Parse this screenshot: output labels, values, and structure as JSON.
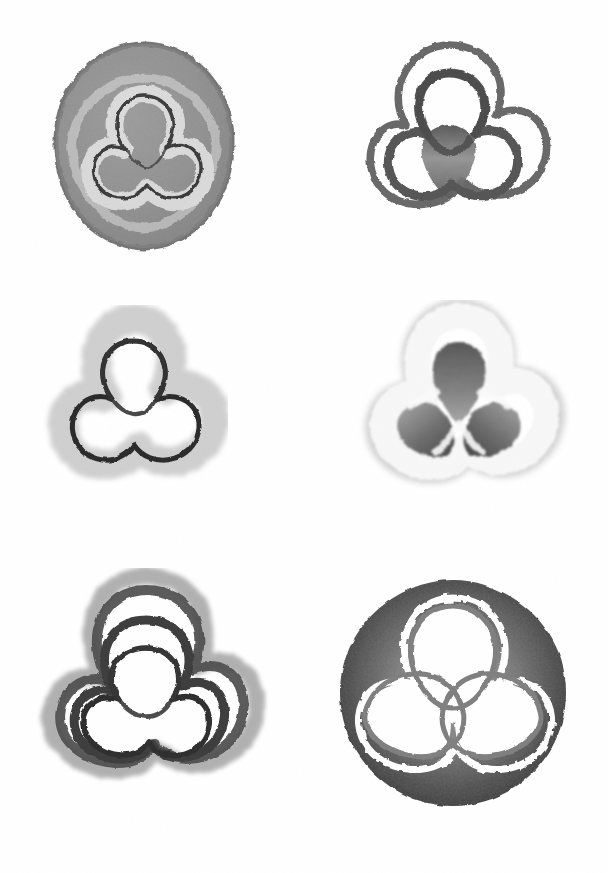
{
  "sheet": {
    "title": "Trefoil Knot Shading Studies",
    "medium": "graphite pencil on white paper",
    "background_color": "#ffffff",
    "width": 608,
    "height": 873,
    "columns": 2,
    "rows": 3,
    "figure_count": 6
  },
  "palette": {
    "paper_white": "#ffffff",
    "near_white": "#f6f6f6",
    "light_grey": "#cfcfcf",
    "mid_grey": "#9a9a9a",
    "grey": "#7d7d7d",
    "dark_grey": "#4a4a4a",
    "near_black": "#2b2b2b",
    "line_black": "#1f1f1f"
  },
  "figures": [
    {
      "id": "figure-1",
      "name": "solid-grey-blob-with-inset-trefoil",
      "position": "top-left",
      "row": 1,
      "column": 1,
      "bounds": {
        "x": 48,
        "y": 38,
        "width": 192,
        "height": 216
      },
      "description": "Rounded triangular grey blob, uniformly shaded mid-grey, with a thin dark trefoil knot line inset and a pale halo band following the knot",
      "fill_style": "solid-wash",
      "fill_color": "#9a9a9a",
      "edge_color": "#6f6f6f",
      "knot_line_color": "#3a3a3a",
      "knot_line_width": 3.2,
      "halo_color": "#e9e9e9",
      "halo_width": 14
    },
    {
      "id": "figure-2",
      "name": "double-outline-trefoil-with-shaded-core",
      "position": "top-right",
      "row": 1,
      "column": 2,
      "bounds": {
        "x": 340,
        "y": 33,
        "width": 218,
        "height": 222
      },
      "description": "Unfilled trefoil knot drawn as a dark band, surrounded by a second offset outer contour, with the central triangular cusp region shaded grey",
      "fill_style": "outline-only",
      "fill_color": "#ffffff",
      "edge_color": "#4f4f4f",
      "knot_line_color": "#5a5a5a",
      "knot_line_width": 9,
      "outer_contour_width": 7,
      "core_shading_color": "#6a6a6a"
    },
    {
      "id": "figure-3",
      "name": "black-trefoil-with-soft-grey-halo",
      "position": "middle-left",
      "row": 2,
      "column": 1,
      "bounds": {
        "x": 38,
        "y": 305,
        "width": 190,
        "height": 200
      },
      "description": "Crisp near-black trefoil knot line with a soft pale grey halo offset outward from the line",
      "fill_style": "halo",
      "fill_color": "#ffffff",
      "edge_color": "#c2c2c2",
      "knot_line_color": "#2b2b2b",
      "knot_line_width": 5,
      "halo_color": "#c8c8c8",
      "halo_width": 26
    },
    {
      "id": "figure-4",
      "name": "white-trefoil-with-dark-filled-lobes",
      "position": "middle-right",
      "row": 2,
      "column": 2,
      "bounds": {
        "x": 348,
        "y": 300,
        "width": 222,
        "height": 218
      },
      "description": "Trefoil drawn in soft white with the three lobe interiors filled with graded grey graphite shading, darkest at the lobe edges",
      "fill_style": "lobe-fill",
      "fill_color": "#ffffff",
      "edge_color": "#b9b9b9",
      "knot_line_color": "#f2f2f2",
      "knot_line_width": 14,
      "lobe_fill_color": "#8a8a8a",
      "lobe_fill_dark": "#5e5e5e"
    },
    {
      "id": "figure-5",
      "name": "concentric-nested-trefoil-contours",
      "position": "bottom-left",
      "row": 3,
      "column": 1,
      "bounds": {
        "x": 24,
        "y": 568,
        "width": 244,
        "height": 262
      },
      "description": "Trefoil knot repeated as several nested contour bands of decreasing radius, dark outline inside a paler grey outer band with a clear white gap between",
      "fill_style": "concentric-contours",
      "fill_color": "#ffffff",
      "edge_color": "#8f8f8f",
      "knot_line_color": "#3a3a3a",
      "knot_line_width": 5,
      "contour_count": 4,
      "contour_gap": 11
    },
    {
      "id": "figure-6",
      "name": "dark-disc-with-white-trefoil-cutout",
      "position": "bottom-right",
      "row": 3,
      "column": 2,
      "bounds": {
        "x": 330,
        "y": 570,
        "width": 246,
        "height": 244
      },
      "description": "Heavily shaded dark circular disc with a white trefoil knot cut out of it, the disc darkest at the rim and lighter toward the centre",
      "fill_style": "solid-disc-cutout",
      "fill_color": "#4a4a4a",
      "edge_color": "#2f2f2f",
      "knot_line_color": "#ffffff",
      "knot_line_width": 7,
      "rim_color": "#343434",
      "inner_color": "#9c9c9c"
    }
  ]
}
